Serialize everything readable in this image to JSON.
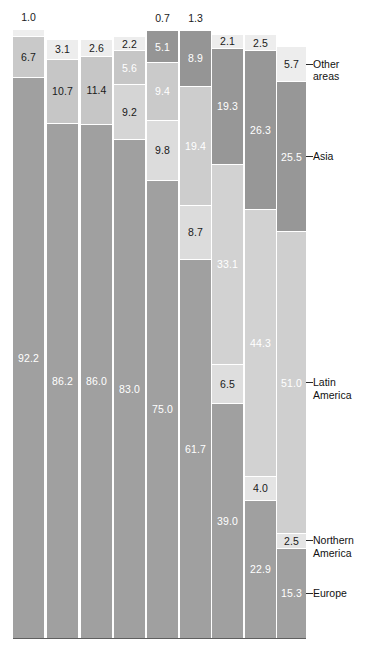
{
  "chart_data": {
    "type": "bar",
    "subtype": "stacked-100-percent",
    "title": "",
    "xlabel": "",
    "ylabel": "",
    "ylim": [
      0,
      100
    ],
    "grid": false,
    "legend_position": "right",
    "orientation": "vertical",
    "categories": [
      "1",
      "2",
      "3",
      "4",
      "5",
      "6",
      "7",
      "8",
      "9"
    ],
    "series": [
      {
        "name": "Other areas",
        "color": "#e9e9e9",
        "values": [
          1.0,
          3.1,
          2.6,
          2.2,
          0.7,
          1.3,
          2.1,
          2.5,
          5.7
        ]
      },
      {
        "name": "Asia",
        "color": "#9b9b9b",
        "values": [
          6.7,
          10.7,
          11.4,
          5.6,
          5.1,
          8.9,
          19.3,
          26.3,
          25.5
        ]
      },
      {
        "name": "Latin America",
        "color": "#cfcfcf",
        "values": [
          0.0,
          0.0,
          0.0,
          9.2,
          9.4,
          19.4,
          33.1,
          44.3,
          51.0
        ]
      },
      {
        "name": "Northern America",
        "color": "#8f8f8f",
        "values": [
          0.0,
          0.0,
          0.0,
          0.0,
          9.8,
          8.7,
          6.5,
          4.0,
          2.5
        ]
      },
      {
        "name": "Europe",
        "color": "#9e9e9e",
        "values": [
          92.2,
          86.2,
          86.0,
          83.0,
          75.0,
          61.7,
          39.0,
          22.9,
          15.3
        ]
      }
    ],
    "bars": [
      {
        "index": 1,
        "top_label": "1.0",
        "top_label_outside": true,
        "segments": [
          {
            "series": "Other areas",
            "value": "1.0",
            "label_inside": false,
            "color": "#eeeeee",
            "text": "dark"
          },
          {
            "series": "Asia",
            "value": "6.7",
            "label_inside": true,
            "color": "#c9c9c9",
            "text": "dark"
          },
          {
            "series": "Europe",
            "value": "92.2",
            "label_inside": true,
            "color": "#a0a0a0",
            "text": "light"
          }
        ]
      },
      {
        "index": 2,
        "top_label": "",
        "top_label_outside": false,
        "segments": [
          {
            "series": "Other areas",
            "value": "3.1",
            "label_inside": true,
            "color": "#ededed",
            "text": "dark"
          },
          {
            "series": "Asia",
            "value": "10.7",
            "label_inside": true,
            "color": "#c6c6c6",
            "text": "dark"
          },
          {
            "series": "Europe",
            "value": "86.2",
            "label_inside": true,
            "color": "#a0a0a0",
            "text": "light"
          }
        ]
      },
      {
        "index": 3,
        "top_label": "",
        "top_label_outside": false,
        "segments": [
          {
            "series": "Other areas",
            "value": "2.6",
            "label_inside": true,
            "color": "#ededed",
            "text": "dark"
          },
          {
            "series": "Asia",
            "value": "11.4",
            "label_inside": true,
            "color": "#c6c6c6",
            "text": "dark"
          },
          {
            "series": "Europe",
            "value": "86.0",
            "label_inside": true,
            "color": "#a0a0a0",
            "text": "light"
          }
        ]
      },
      {
        "index": 4,
        "top_label": "",
        "top_label_outside": false,
        "segments": [
          {
            "series": "Other areas",
            "value": "2.2",
            "label_inside": true,
            "color": "#ededed",
            "text": "dark"
          },
          {
            "series": "Asia",
            "value": "5.6",
            "label_inside": true,
            "color": "#c6c6c6",
            "text": "light"
          },
          {
            "series": "Latin America",
            "value": "9.2",
            "label_inside": true,
            "color": "#d5d5d5",
            "text": "dark"
          },
          {
            "series": "Europe",
            "value": "83.0",
            "label_inside": true,
            "color": "#a0a0a0",
            "text": "light"
          }
        ]
      },
      {
        "index": 5,
        "top_label": "0.7",
        "top_label_outside": true,
        "segments": [
          {
            "series": "Asia",
            "value": "5.1",
            "label_inside": true,
            "color": "#959595",
            "text": "light"
          },
          {
            "series": "Latin America",
            "value": "9.4",
            "label_inside": true,
            "color": "#cacaca",
            "text": "light"
          },
          {
            "series": "Northern America",
            "value": "9.8",
            "label_inside": true,
            "color": "#dcdcdc",
            "text": "dark"
          },
          {
            "series": "Europe",
            "value": "75.0",
            "label_inside": true,
            "color": "#a0a0a0",
            "text": "light"
          }
        ]
      },
      {
        "index": 6,
        "top_label": "1.3",
        "top_label_outside": true,
        "segments": [
          {
            "series": "Asia",
            "value": "8.9",
            "label_inside": true,
            "color": "#959595",
            "text": "light"
          },
          {
            "series": "Latin America",
            "value": "19.4",
            "label_inside": true,
            "color": "#cdcdcd",
            "text": "light"
          },
          {
            "series": "Northern America",
            "value": "8.7",
            "label_inside": true,
            "color": "#dcdcdc",
            "text": "dark"
          },
          {
            "series": "Europe",
            "value": "61.7",
            "label_inside": true,
            "color": "#a0a0a0",
            "text": "light"
          }
        ]
      },
      {
        "index": 7,
        "top_label": "",
        "top_label_outside": false,
        "segments": [
          {
            "series": "Other areas",
            "value": "2.1",
            "label_inside": true,
            "color": "#ededed",
            "text": "dark"
          },
          {
            "series": "Asia",
            "value": "19.3",
            "label_inside": true,
            "color": "#979797",
            "text": "light"
          },
          {
            "series": "Latin America",
            "value": "33.1",
            "label_inside": true,
            "color": "#d2d2d2",
            "text": "light"
          },
          {
            "series": "Northern America",
            "value": "6.5",
            "label_inside": true,
            "color": "#dedede",
            "text": "dark"
          },
          {
            "series": "Europe",
            "value": "39.0",
            "label_inside": true,
            "color": "#a0a0a0",
            "text": "light"
          }
        ]
      },
      {
        "index": 8,
        "top_label": "",
        "top_label_outside": false,
        "segments": [
          {
            "series": "Other areas",
            "value": "2.5",
            "label_inside": true,
            "color": "#ededed",
            "text": "dark"
          },
          {
            "series": "Asia",
            "value": "26.3",
            "label_inside": true,
            "color": "#979797",
            "text": "light"
          },
          {
            "series": "Latin America",
            "value": "44.3",
            "label_inside": true,
            "color": "#d2d2d2",
            "text": "light"
          },
          {
            "series": "Northern America",
            "value": "4.0",
            "label_inside": true,
            "color": "#e4e4e4",
            "text": "dark"
          },
          {
            "series": "Europe",
            "value": "22.9",
            "label_inside": true,
            "color": "#a0a0a0",
            "text": "light"
          }
        ]
      },
      {
        "index": 9,
        "top_label": "",
        "top_label_outside": false,
        "segments": [
          {
            "series": "Other areas",
            "value": "5.7",
            "label_inside": true,
            "color": "#ededed",
            "text": "dark"
          },
          {
            "series": "Asia",
            "value": "25.5",
            "label_inside": true,
            "color": "#979797",
            "text": "light"
          },
          {
            "series": "Latin America",
            "value": "51.0",
            "label_inside": true,
            "color": "#cfcfcf",
            "text": "light"
          },
          {
            "series": "Northern America",
            "value": "2.5",
            "label_inside": true,
            "color": "#e4e4e4",
            "text": "dark"
          },
          {
            "series": "Europe",
            "value": "15.3",
            "label_inside": true,
            "color": "#a0a0a0",
            "text": "light"
          }
        ]
      }
    ],
    "legend": [
      {
        "label": "Other areas",
        "lines": [
          "Other",
          "areas"
        ]
      },
      {
        "label": "Asia",
        "lines": [
          "Asia"
        ]
      },
      {
        "label": "Latin America",
        "lines": [
          "Latin",
          "America"
        ]
      },
      {
        "label": "Northern America",
        "lines": [
          "Northern",
          "America"
        ]
      },
      {
        "label": "Europe",
        "lines": [
          "Europe"
        ]
      }
    ]
  }
}
